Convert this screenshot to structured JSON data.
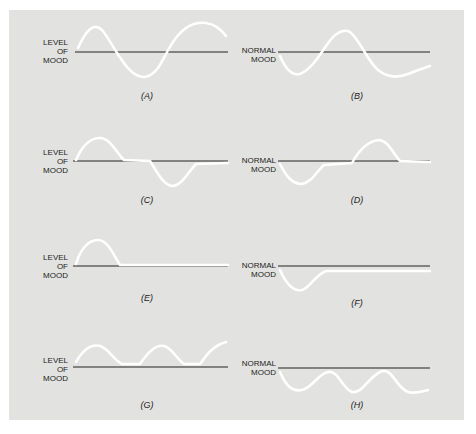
{
  "figure": {
    "background": "#e2e2e0",
    "curve_color": "#ffffff",
    "baseline_color": "#222222",
    "panels": [
      {
        "id": "A",
        "caption": "(A)",
        "ylabel": [
          "LEVEL",
          "OF",
          "MOOD"
        ],
        "description": "Alternating mania and depression cycles"
      },
      {
        "id": "B",
        "caption": "(B)",
        "ylabel": [
          "NORMAL",
          "MOOD"
        ],
        "description": "Alternating depression and mania cycles"
      },
      {
        "id": "C",
        "caption": "(C)",
        "ylabel": [
          "LEVEL",
          "OF",
          "MOOD"
        ],
        "description": "Manic episode, normal interval, depressive episode"
      },
      {
        "id": "D",
        "caption": "(D)",
        "ylabel": [
          "NORMAL",
          "MOOD"
        ],
        "description": "Depressive episode, normal interval, manic episode"
      },
      {
        "id": "E",
        "caption": "(E)",
        "ylabel": [
          "LEVEL",
          "OF",
          "MOOD"
        ],
        "description": "Single manic episode then normal"
      },
      {
        "id": "F",
        "caption": "(F)",
        "ylabel": [
          "NORMAL",
          "MOOD"
        ],
        "description": "Single depressive episode then normal"
      },
      {
        "id": "G",
        "caption": "(G)",
        "ylabel": [
          "LEVEL",
          "OF",
          "MOOD"
        ],
        "description": "Recurrent manic episodes"
      },
      {
        "id": "H",
        "caption": "(H)",
        "ylabel": [
          "NORMAL",
          "MOOD"
        ],
        "description": "Recurrent depressive episodes"
      }
    ]
  }
}
